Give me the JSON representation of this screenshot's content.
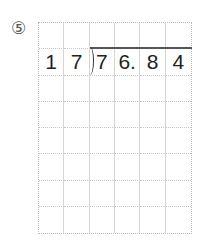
{
  "problem": {
    "number_label": "⑤",
    "divisor": [
      "1",
      "7"
    ],
    "dividend": [
      "7",
      "6.",
      "8",
      "4"
    ],
    "grid": {
      "columns": 6,
      "rows": 8
    }
  }
}
